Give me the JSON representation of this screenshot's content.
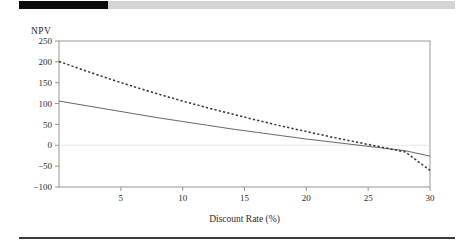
{
  "figure": {
    "y_axis_title": "NPV",
    "x_axis_title": "Discount Rate (%)"
  },
  "chart_data": {
    "type": "line",
    "title": "",
    "subtitle": "",
    "xlabel": "Discount Rate (%)",
    "ylabel": "NPV",
    "xlim": [
      0,
      30
    ],
    "ylim": [
      -100,
      250
    ],
    "xticks": [
      5,
      10,
      15,
      20,
      25,
      30
    ],
    "xtick_labels": [
      "5",
      "10",
      "15",
      "20",
      "25",
      "30"
    ],
    "yticks": [
      -100,
      -50,
      0,
      50,
      100,
      150,
      200,
      250
    ],
    "ytick_labels": [
      "-100",
      "-50",
      "0",
      "50",
      "100",
      "150",
      "200",
      "250"
    ],
    "grid": false,
    "legend": null,
    "legend_position": "none",
    "zero_line": true,
    "x": [
      0,
      2,
      4,
      6,
      8,
      10,
      12,
      14,
      16,
      18,
      20,
      22,
      24,
      26,
      28,
      30
    ],
    "series": [
      {
        "name": "solid-curve",
        "style": "solid",
        "color": "#555555",
        "values": [
          106,
          96,
          86,
          76,
          66,
          57,
          48,
          39,
          31,
          23,
          15,
          8,
          1,
          -6,
          -13,
          -26
        ]
      },
      {
        "name": "dotted-curve",
        "style": "dotted",
        "color": "#333333",
        "values": [
          201,
          180,
          160,
          141,
          123,
          106,
          90,
          75,
          60,
          46,
          33,
          20,
          8,
          -4,
          -16,
          -60
        ]
      }
    ],
    "annotations": []
  }
}
